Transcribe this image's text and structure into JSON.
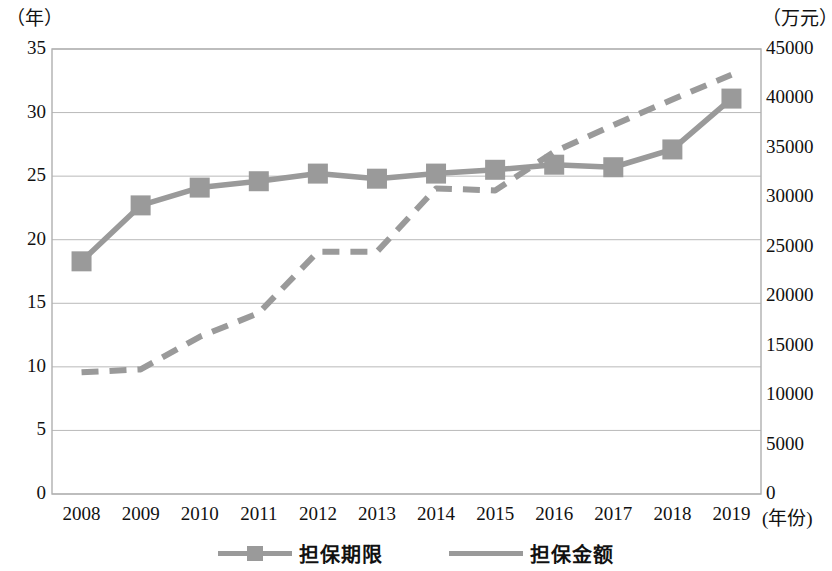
{
  "axes": {
    "left_unit": "（年）",
    "right_unit": "（万元）",
    "x_unit": "(年份)",
    "left_ticks": [
      "35",
      "30",
      "25",
      "20",
      "15",
      "10",
      "5",
      "0"
    ],
    "right_ticks": [
      "45000",
      "40000",
      "35000",
      "30000",
      "25000",
      "20000",
      "15000",
      "10000",
      "5000",
      "0"
    ]
  },
  "legend": {
    "items": [
      {
        "label": "担保期限",
        "color": "#9a9a9a",
        "style": "solid-with-square-marker"
      },
      {
        "label": "担保金额",
        "color": "#9a9a9a",
        "style": "dashed"
      }
    ]
  },
  "colors": {
    "series": "#9a9a9a",
    "grid": "#b9b9b9",
    "frame": "#b0b0b0",
    "text": "#111111"
  },
  "chart_data": {
    "type": "line",
    "title": "",
    "xlabel": "(年份)",
    "ylabel": "（年）",
    "y2label": "（万元）",
    "grid": true,
    "legend_position": "bottom",
    "categories": [
      "2008",
      "2009",
      "2010",
      "2011",
      "2012",
      "2013",
      "2014",
      "2015",
      "2016",
      "2017",
      "2018",
      "2019"
    ],
    "ylim": [
      0,
      35
    ],
    "y2lim": [
      0,
      45000
    ],
    "ytick_step": 5,
    "y2tick_step": 5000,
    "series": [
      {
        "name": "担保期限",
        "axis": "left",
        "unit": "年",
        "line_style": "solid",
        "marker": "square",
        "values": [
          18.3,
          22.7,
          24.1,
          24.6,
          25.2,
          24.8,
          25.2,
          25.5,
          25.9,
          25.7,
          27.1,
          31.1
        ]
      },
      {
        "name": "担保金额",
        "axis": "right",
        "unit": "万元",
        "line_style": "dashed",
        "marker": "none",
        "values": [
          12300,
          12600,
          15900,
          18300,
          24500,
          24500,
          30900,
          30700,
          34600,
          37300,
          39900,
          42400
        ]
      }
    ]
  }
}
